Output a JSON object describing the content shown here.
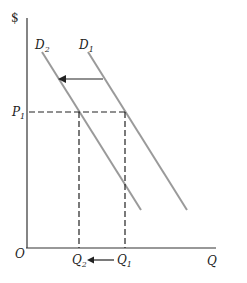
{
  "diagram": {
    "type": "supply-demand",
    "axes": {
      "y_label": "$",
      "x_label": "Q",
      "origin_label": "O"
    },
    "curves": [
      {
        "name": "D1",
        "label_main": "D",
        "label_sub": "1",
        "color": "#9a9a9a"
      },
      {
        "name": "D2",
        "label_main": "D",
        "label_sub": "2",
        "color": "#9a9a9a"
      }
    ],
    "price_marker": {
      "main": "P",
      "sub": "1"
    },
    "quantity_markers": [
      {
        "name": "Q1",
        "main": "Q",
        "sub": "1"
      },
      {
        "name": "Q2",
        "main": "Q",
        "sub": "2"
      }
    ],
    "shift_arrow": {
      "from": "D1",
      "to": "D2",
      "direction": "left"
    },
    "quantity_arrow": {
      "from": "Q1",
      "to": "Q2",
      "direction": "left"
    }
  }
}
